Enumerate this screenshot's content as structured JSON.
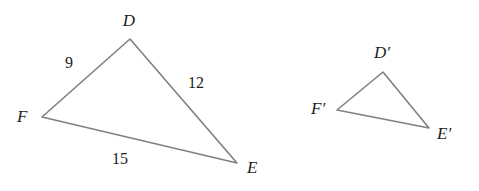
{
  "figure": {
    "background_color": "#ffffff",
    "stroke_color": "#808080",
    "stroke_width": 1.6,
    "text_color": "#1c1c1c",
    "vertex_label_font_size": 17,
    "side_label_font_size": 16,
    "prime_label_font_size": 17
  },
  "chart_data": {
    "type": "diagram",
    "xlabel": "",
    "ylabel": "",
    "shapes": [
      {
        "name": "triangle-def",
        "vertices": [
          {
            "name": "D",
            "x": 130,
            "y": 39
          },
          {
            "name": "E",
            "x": 237,
            "y": 163
          },
          {
            "name": "F",
            "x": 42,
            "y": 117
          }
        ],
        "side_lengths": [
          {
            "from": "F",
            "to": "D",
            "value": 9
          },
          {
            "from": "D",
            "to": "E",
            "value": 12
          },
          {
            "from": "F",
            "to": "E",
            "value": 15
          }
        ]
      },
      {
        "name": "triangle-def-prime",
        "vertices": [
          {
            "name": "D'",
            "x": 383,
            "y": 72
          },
          {
            "name": "E'",
            "x": 429,
            "y": 128
          },
          {
            "name": "F'",
            "x": 337,
            "y": 110
          }
        ],
        "side_lengths": []
      }
    ]
  },
  "left_triangle": {
    "name": "triangle-def",
    "path": "M 130 39 L 237 163 L 42 117 Z",
    "vertex_labels": [
      {
        "id": "D",
        "text": "D",
        "x": 129,
        "y": 26,
        "anchor": "middle"
      },
      {
        "id": "E",
        "text": "E",
        "x": 247,
        "y": 173,
        "anchor": "start"
      },
      {
        "id": "F",
        "text": "F",
        "x": 17,
        "y": 122,
        "anchor": "start"
      }
    ],
    "side_labels": [
      {
        "id": "FD",
        "text": "9",
        "x": 69,
        "y": 68,
        "anchor": "middle"
      },
      {
        "id": "DE",
        "text": "12",
        "x": 196,
        "y": 88,
        "anchor": "middle"
      },
      {
        "id": "FE",
        "text": "15",
        "x": 120,
        "y": 164,
        "anchor": "middle"
      }
    ]
  },
  "right_triangle": {
    "name": "triangle-def-prime",
    "path": "M 383 72 L 429 128 L 337 110 Z",
    "vertex_labels": [
      {
        "id": "Dprime",
        "text": "D′",
        "x": 382,
        "y": 58,
        "anchor": "middle"
      },
      {
        "id": "Eprime",
        "text": "E′",
        "x": 437,
        "y": 139,
        "anchor": "start"
      },
      {
        "id": "Fprime",
        "text": "F′",
        "x": 311,
        "y": 114,
        "anchor": "start"
      }
    ],
    "side_labels": []
  }
}
